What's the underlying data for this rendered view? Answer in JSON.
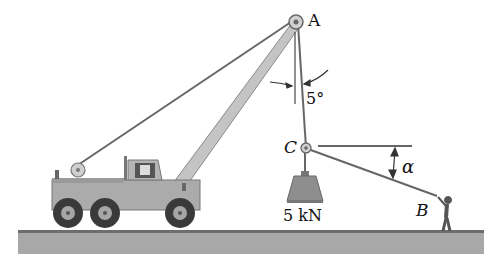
{
  "diagram": {
    "labels": {
      "point_a": "A",
      "point_b": "B",
      "point_c": "C",
      "angle_deg": "5°",
      "angle_alpha": "α",
      "load": "5 kN"
    },
    "elements": [
      {
        "id": "truck",
        "desc": "mobile crane truck"
      },
      {
        "id": "boom",
        "desc": "crane boom from truck to pulley A"
      },
      {
        "id": "cable-ac",
        "desc": "cable from A down to C, 5° from vertical"
      },
      {
        "id": "rope-cb",
        "desc": "rope from C to person at B at angle α below horizontal"
      },
      {
        "id": "weight",
        "desc": "5 kN load hanging at C"
      },
      {
        "id": "ground",
        "desc": "ground surface"
      }
    ],
    "colors": {
      "line": "#555555",
      "boom": "#b8b8b8",
      "truck_body": "#a9a9a9",
      "tire": "#3a3a3a",
      "ground": "#9a9a9a",
      "weight": "#8a8a8a"
    }
  }
}
